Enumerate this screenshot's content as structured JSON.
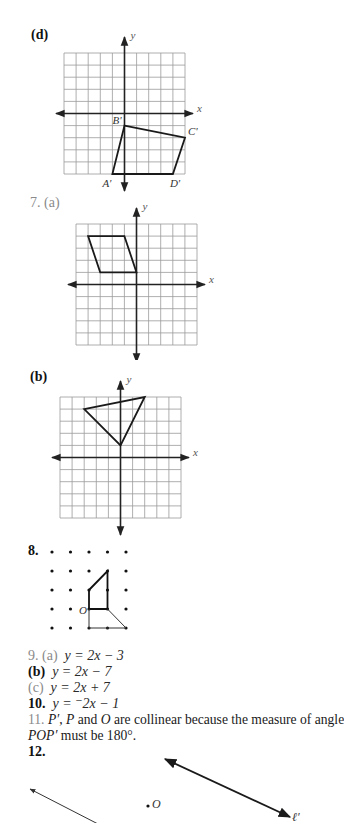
{
  "graphs": {
    "d": {
      "label": "(d)",
      "x_axis_label": "x",
      "y_axis_label": "y",
      "grid": {
        "min": -5,
        "max": 5
      },
      "polygon": [
        {
          "name": "B'",
          "x": 0,
          "y": -1
        },
        {
          "name": "C'",
          "x": 5,
          "y": -2
        },
        {
          "name": "D'",
          "x": 4,
          "y": -5
        },
        {
          "name": "A'",
          "x": -1,
          "y": -5
        }
      ]
    },
    "7a": {
      "label": "7. (a)",
      "x_axis_label": "x",
      "y_axis_label": "y",
      "grid": {
        "min": -5,
        "max": 5
      },
      "polygon": [
        {
          "x": -4,
          "y": 4
        },
        {
          "x": -1,
          "y": 4
        },
        {
          "x": 0,
          "y": 1
        },
        {
          "x": -3,
          "y": 1
        }
      ]
    },
    "7b": {
      "label": "(b)",
      "x_axis_label": "x",
      "y_axis_label": "y",
      "grid": {
        "min": -5,
        "max": 5
      },
      "polygon": [
        {
          "x": -3,
          "y": 4
        },
        {
          "x": 2,
          "y": 5
        },
        {
          "x": 0,
          "y": 1
        }
      ]
    }
  },
  "problem8": {
    "label": "8.",
    "dot_grid": {
      "cols": 5,
      "rows": 5
    },
    "center_label": "O",
    "bold_path": [
      [
        2,
        2
      ],
      [
        3,
        1
      ],
      [
        3,
        3
      ],
      [
        2,
        3
      ],
      [
        2,
        2
      ]
    ],
    "thin_path": [
      [
        2,
        3
      ],
      [
        2,
        4
      ],
      [
        4,
        4
      ],
      [
        3,
        3
      ]
    ]
  },
  "answers": {
    "a9": {
      "num": "9. (a)",
      "eq": "y = 2x − 3"
    },
    "b9": {
      "num": "(b)",
      "eq": "y = 2x − 7"
    },
    "c9": {
      "num": "(c)",
      "eq": "y = 2x + 7"
    },
    "a10": {
      "num": "10.",
      "eq": "y = ⁻2x − 1"
    },
    "a11": {
      "num": "11.",
      "line1_p1": "P′",
      "line1_sep1": ", ",
      "line1_p2": "P",
      "line1_mid": " and ",
      "line1_o": "O",
      "line1_rest": " are collinear because the measure of angle",
      "line2_angle": "POP′",
      "line2_rest": " must be 180°."
    },
    "a12": {
      "num": "12.",
      "point_label": "O",
      "line_label": "ℓ′"
    }
  }
}
